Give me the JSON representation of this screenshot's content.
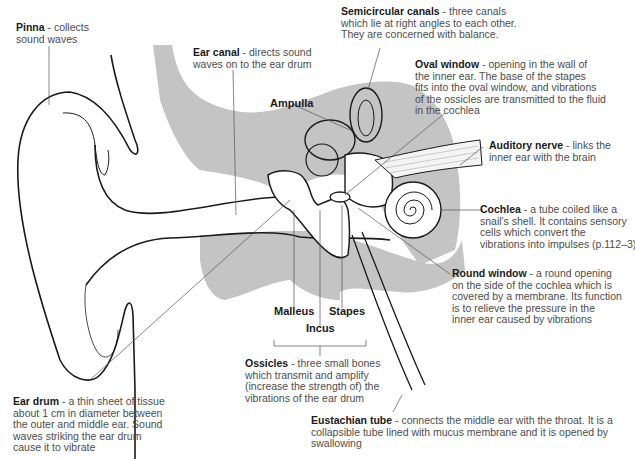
{
  "diagram": {
    "colors": {
      "shading": "#c4c4c4",
      "outline": "#1a1a1a",
      "leader": "#555555"
    },
    "labels": {
      "pinna": {
        "term": "Pinna",
        "desc": [
          " - collects",
          "sound waves"
        ]
      },
      "semicircular": {
        "term": "Semicircular canals",
        "desc": [
          " - three canals",
          "which lie at right angles to each other.",
          "They are concerned with balance."
        ]
      },
      "ear_canal": {
        "term": "Ear canal",
        "desc": [
          " - directs sound",
          "waves on to the ear drum"
        ]
      },
      "oval_window": {
        "term": "Oval window",
        "desc": [
          " - opening in the wall of",
          "the inner ear. The base of the stapes",
          "fits into the oval window, and vibrations",
          "of the ossicles are transmitted to the fluid",
          "in the cochlea"
        ]
      },
      "ampulla": {
        "term": "Ampulla"
      },
      "auditory_nerve": {
        "term": "Auditory nerve",
        "desc": [
          " - links the",
          "inner ear with the brain"
        ]
      },
      "cochlea": {
        "term": "Cochlea",
        "desc": [
          " - a tube coiled like a",
          "snail's shell. It contains sensory",
          "cells which convert the",
          "vibrations into impulses (p.112–3)"
        ]
      },
      "round_window": {
        "term": "Round window",
        "desc": [
          " - a round opening",
          "on the side of the cochlea which is",
          "covered by a membrane. Its function",
          "is to relieve the pressure in the",
          "inner ear caused by vibrations"
        ]
      },
      "malleus": {
        "term": "Malleus"
      },
      "stapes": {
        "term": "Stapes"
      },
      "incus": {
        "term": "Incus"
      },
      "ossicles": {
        "term": "Ossicles",
        "desc": [
          " - three small bones",
          "which transmit and amplify",
          "(increase the strength of) the",
          "vibrations of the ear drum"
        ]
      },
      "ear_drum": {
        "term": "Ear drum",
        "desc": [
          " - a thin sheet of tissue",
          "about 1 cm in diameter between",
          "the outer and middle ear. Sound",
          "waves striking the ear drum",
          "cause it to vibrate"
        ]
      },
      "eustachian": {
        "term": "Eustachian tube",
        "desc": [
          " - connects the middle ear with the throat. It is a",
          "collapsible tube lined with mucus membrane and it is opened by",
          "swallowing"
        ]
      }
    }
  }
}
